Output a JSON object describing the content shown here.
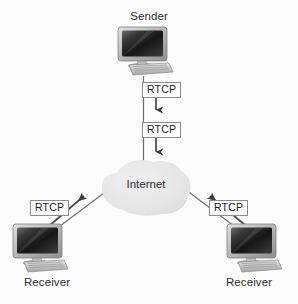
{
  "diagram": {
    "background_color": "#fdfdfd"
  },
  "nodes": {
    "sender": {
      "label": "Sender",
      "icon": "desktop-computer-icon",
      "position": "top-center"
    },
    "cloud": {
      "label": "Internet",
      "icon": "cloud-icon",
      "fill_color": "#e8e8e8",
      "position": "center"
    },
    "receiver_left": {
      "label": "Receiver",
      "icon": "desktop-computer-icon",
      "position": "bottom-left"
    },
    "receiver_right": {
      "label": "Receiver",
      "icon": "desktop-computer-icon",
      "position": "bottom-right"
    }
  },
  "edges": [
    {
      "id": "sender-to-cloud",
      "from": "sender",
      "to": "cloud",
      "direction": "down",
      "tags": [
        "RTCP",
        "RTCP"
      ]
    },
    {
      "id": "receiver-left-to-cloud",
      "from": "receiver_left",
      "to": "cloud",
      "direction": "up-right",
      "tags": [
        "RTCP"
      ]
    },
    {
      "id": "receiver-right-to-cloud",
      "from": "receiver_right",
      "to": "cloud",
      "direction": "up-left",
      "tags": [
        "RTCP"
      ]
    }
  ],
  "tags": {
    "rtcp_sender_1": "RTCP",
    "rtcp_sender_2": "RTCP",
    "rtcp_receiver_left": "RTCP",
    "rtcp_receiver_right": "RTCP"
  },
  "colors": {
    "line": "#4a4a4a",
    "cloud": "#e8e8e8",
    "screen_dark": "#1f1f1f",
    "bezel": "#c9c9c9",
    "text": "#2b2b2b",
    "box_border": "#8c8c8c"
  }
}
